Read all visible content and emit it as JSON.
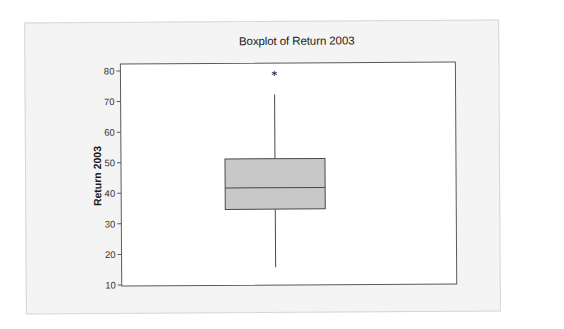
{
  "chart_data": {
    "type": "boxplot",
    "title": "Boxplot of Return 2003",
    "xlabel": "",
    "ylabel": "Return 2003",
    "ylim": [
      10,
      80
    ],
    "yticks": [
      10,
      20,
      30,
      40,
      50,
      60,
      70,
      80
    ],
    "ytick_labels": [
      "10",
      "20",
      "30",
      "40",
      "50",
      "60",
      "70",
      "80"
    ],
    "grid": false,
    "legend": null,
    "series": [
      {
        "name": "Return 2003",
        "whisker_low": 15.5,
        "q1": 34.5,
        "median": 41.5,
        "q3": 51,
        "whisker_high": 72,
        "outliers": [
          78.7
        ]
      }
    ],
    "colors": {
      "box_fill": "#c8c8c8",
      "box_stroke": "#4a4a4a",
      "panel_bg": "#f4f4f4",
      "plot_bg": "#ffffff",
      "outlier_marker": "*"
    }
  }
}
